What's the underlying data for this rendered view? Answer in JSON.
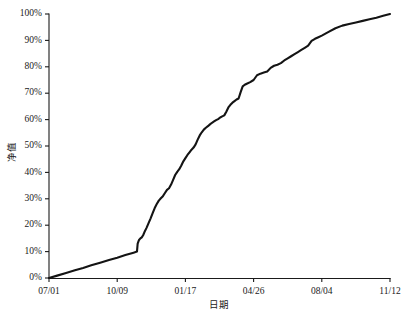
{
  "chart_data": {
    "type": "line",
    "title": "",
    "xlabel": "日期",
    "ylabel": "净值",
    "xlim": [
      0,
      500
    ],
    "ylim": [
      0,
      100
    ],
    "grid": false,
    "legend": null,
    "x_tick_labels": [
      "07/01",
      "10/09",
      "01/17",
      "04/26",
      "08/04",
      "11/12"
    ],
    "x_tick_values": [
      0,
      100,
      200,
      300,
      400,
      500
    ],
    "y_tick_labels": [
      "0%",
      "10%",
      "20%",
      "30%",
      "40%",
      "50%",
      "60%",
      "70%",
      "80%",
      "90%",
      "100%"
    ],
    "y_tick_values": [
      0,
      10,
      20,
      30,
      40,
      50,
      60,
      70,
      80,
      90,
      100
    ],
    "series": [
      {
        "name": "净值",
        "color": "#141414",
        "x": [
          0,
          12,
          25,
          38,
          50,
          62,
          75,
          88,
          100,
          112,
          124,
          129,
          130,
          132,
          134,
          136,
          138,
          140,
          143,
          146,
          149,
          152,
          155,
          158,
          161,
          164,
          167,
          170,
          173,
          176,
          179,
          182,
          185,
          188,
          191,
          194,
          197,
          200,
          203,
          206,
          209,
          212,
          215,
          218,
          221,
          224,
          227,
          230,
          233,
          236,
          239,
          242,
          245,
          248,
          251,
          254,
          257,
          260,
          263,
          266,
          269,
          272,
          275,
          278,
          281,
          284,
          287,
          290,
          295,
          300,
          305,
          310,
          315,
          320,
          325,
          330,
          335,
          340,
          345,
          350,
          355,
          360,
          365,
          370,
          375,
          380,
          385,
          390,
          395,
          400,
          410,
          420,
          430,
          440,
          450,
          460,
          470,
          480,
          490,
          500
        ],
        "y": [
          0,
          0.9,
          1.9,
          2.9,
          3.8,
          4.8,
          5.8,
          6.8,
          7.7,
          8.7,
          9.6,
          10.0,
          13.0,
          14.4,
          15.0,
          15.4,
          16.2,
          17.4,
          19.0,
          20.8,
          22.6,
          24.6,
          26.5,
          28.0,
          29.3,
          30.2,
          31.0,
          32.2,
          33.4,
          34.0,
          35.4,
          37.2,
          39.0,
          40.2,
          41.2,
          42.6,
          44.2,
          45.4,
          46.6,
          47.6,
          48.6,
          49.4,
          50.6,
          52.4,
          54.0,
          55.2,
          56.2,
          56.9,
          57.5,
          58.2,
          58.8,
          59.3,
          59.8,
          60.2,
          60.8,
          61.2,
          61.6,
          63.0,
          64.6,
          65.6,
          66.4,
          67.0,
          67.6,
          68.0,
          70.4,
          72.6,
          73.2,
          73.6,
          74.2,
          75.0,
          76.8,
          77.4,
          77.8,
          78.2,
          79.6,
          80.4,
          80.8,
          81.4,
          82.4,
          83.2,
          84.0,
          84.8,
          85.6,
          86.4,
          87.2,
          88.0,
          89.8,
          90.6,
          91.2,
          91.8,
          93.2,
          94.6,
          95.6,
          96.2,
          96.8,
          97.4,
          98.0,
          98.6,
          99.3,
          100.0
        ]
      }
    ]
  },
  "axes": {
    "y_axis_name": "net-value-axis",
    "x_axis_name": "date-axis"
  }
}
